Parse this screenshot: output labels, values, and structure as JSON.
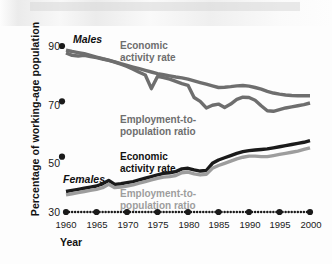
{
  "chart_data": {
    "type": "line",
    "title": "",
    "xlabel": "Year",
    "ylabel": "Percentage of working-age population",
    "xlim": [
      1960,
      2000
    ],
    "ylim": [
      30,
      90
    ],
    "grid": false,
    "legend_position": "inline-annotations",
    "x_ticks": [
      "1960",
      "1965",
      "1970",
      "1975",
      "1980",
      "1985",
      "1990",
      "1995",
      "2000"
    ],
    "y_ticks": [
      "30",
      "50",
      "70",
      "90"
    ],
    "x": [
      1960,
      1961,
      1962,
      1963,
      1964,
      1965,
      1966,
      1967,
      1968,
      1969,
      1970,
      1971,
      1972,
      1973,
      1974,
      1975,
      1976,
      1977,
      1978,
      1979,
      1980,
      1981,
      1982,
      1983,
      1984,
      1985,
      1986,
      1987,
      1988,
      1989,
      1990,
      1991,
      1992,
      1993,
      1994,
      1995,
      1996,
      1997,
      1998,
      1999,
      2000
    ],
    "series": [
      {
        "name": "Males Economic activity rate",
        "group": "Males",
        "color": "#6e6e6e",
        "values": [
          88.5,
          88.0,
          87.6,
          87.2,
          86.6,
          86.0,
          85.4,
          84.9,
          84.3,
          83.6,
          83.0,
          82.4,
          81.8,
          81.2,
          80.6,
          80.0,
          79.6,
          79.2,
          78.8,
          78.5,
          78.0,
          77.4,
          76.8,
          76.2,
          75.6,
          75.0,
          75.1,
          75.3,
          75.6,
          75.7,
          75.5,
          75.0,
          74.4,
          73.6,
          73.0,
          72.6,
          72.3,
          72.1,
          72.0,
          72.0,
          72.0
        ]
      },
      {
        "name": "Males Employment-to-population ratio",
        "group": "Males",
        "color": "#6e6e6e",
        "values": [
          87.5,
          86.6,
          86.4,
          86.6,
          86.2,
          85.8,
          85.3,
          84.8,
          84.2,
          83.4,
          82.6,
          81.6,
          80.5,
          79.5,
          74.6,
          79.0,
          78.6,
          78.0,
          77.2,
          76.4,
          75.8,
          71.4,
          70.0,
          67.6,
          68.6,
          69.0,
          67.8,
          69.0,
          70.7,
          71.5,
          71.4,
          70.4,
          68.4,
          66.6,
          66.4,
          67.0,
          67.6,
          68.0,
          68.4,
          68.8,
          69.4
        ]
      },
      {
        "name": "Females Economic activity rate",
        "group": "Females",
        "color": "#1a1a1a",
        "values": [
          37.4,
          37.8,
          38.2,
          38.6,
          39.0,
          39.4,
          40.2,
          41.4,
          40.0,
          40.2,
          40.6,
          41.0,
          41.6,
          42.2,
          42.8,
          43.4,
          44.0,
          44.2,
          44.6,
          45.6,
          45.8,
          45.2,
          44.8,
          45.0,
          47.6,
          48.8,
          49.6,
          50.4,
          51.2,
          51.8,
          52.2,
          52.4,
          52.6,
          52.8,
          53.2,
          53.6,
          54.0,
          54.4,
          54.8,
          55.2,
          55.8
        ]
      },
      {
        "name": "Females Employment-to-population ratio",
        "group": "Females",
        "color": "#9d9d9d",
        "values": [
          36.2,
          36.6,
          37.0,
          37.4,
          37.8,
          38.2,
          38.8,
          40.0,
          38.8,
          39.0,
          39.4,
          39.8,
          40.4,
          41.0,
          41.6,
          42.2,
          42.6,
          42.8,
          43.2,
          44.2,
          44.4,
          43.8,
          43.4,
          43.6,
          45.8,
          46.8,
          47.6,
          48.4,
          49.2,
          49.8,
          50.2,
          50.2,
          50.0,
          50.0,
          50.4,
          50.8,
          51.2,
          51.6,
          52.0,
          52.6,
          53.2
        ]
      }
    ],
    "annotations": [
      {
        "id": "males-group",
        "text": "Males",
        "style": "bold-italic",
        "color": "#111111"
      },
      {
        "id": "females-group",
        "text": "Females",
        "style": "bold-italic",
        "color": "#111111"
      },
      {
        "id": "males-ear",
        "text": "Economic\nactivity rate",
        "color": "#6e6e6e"
      },
      {
        "id": "males-epr",
        "text": "Employment-to-\npopulation ratio",
        "color": "#6e6e6e"
      },
      {
        "id": "females-ear",
        "text": "Economic\nactivity rate",
        "color": "#111111"
      },
      {
        "id": "females-epr",
        "text": "Employment-to-\npopulation ratio",
        "color": "#9d9d9d"
      }
    ]
  },
  "colors": {
    "males_line": "#6e6e6e",
    "females_activity_line": "#1a1a1a",
    "females_employment_line": "#9d9d9d",
    "axis": "#1a1a1a",
    "background": "#fdfdfd"
  }
}
